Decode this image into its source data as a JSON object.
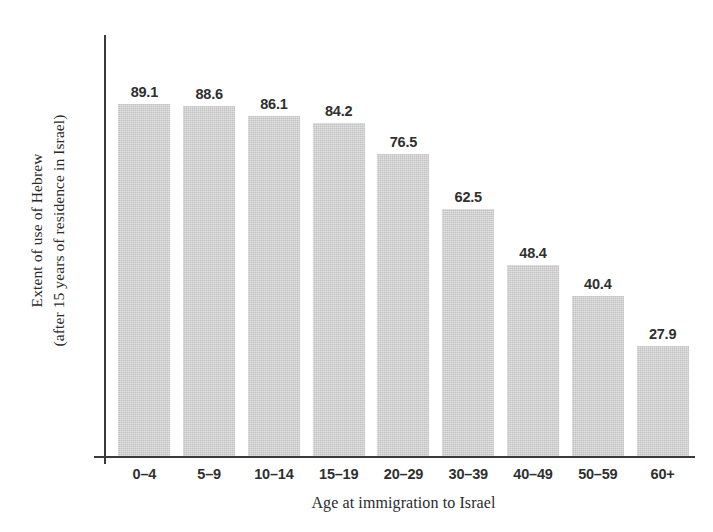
{
  "chart_data": {
    "type": "bar",
    "title": "",
    "xlabel": "Age at immigration to Israel",
    "ylabel_line1": "Extent of use of Hebrew",
    "ylabel_line2": "(after 15 years of residence in Israel)",
    "categories": [
      "0–4",
      "5–9",
      "10–14",
      "15–19",
      "20–29",
      "30–39",
      "40–49",
      "50–59",
      "60+"
    ],
    "values": [
      89.1,
      88.6,
      86.1,
      84.2,
      76.5,
      62.5,
      48.4,
      40.4,
      27.9
    ],
    "value_labels": [
      "89.1",
      "88.6",
      "86.1",
      "84.2",
      "76.5",
      "62.5",
      "48.4",
      "40.4",
      "27.9"
    ],
    "ylim": [
      0,
      100
    ],
    "grid": false,
    "legend": false,
    "y_tick_labels": [],
    "bar_color": "#c8c8c8",
    "axis_color": "#3a3a3a",
    "text_color": "#2f2f2f",
    "background_color": "#ffffff"
  }
}
